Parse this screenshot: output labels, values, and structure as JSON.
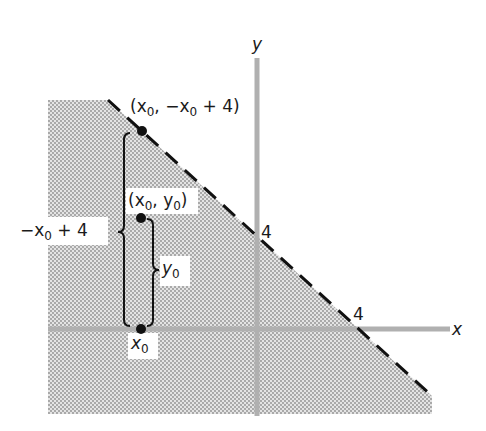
{
  "figure": {
    "axes": {
      "x_label": "x",
      "y_label": "y",
      "x_intercept_label": "4",
      "y_intercept_label": "4",
      "axis_color": "#b0b0b0"
    },
    "boundary_line": {
      "equation": "y = -x + 4",
      "style": "dashed",
      "color": "#111111"
    },
    "shaded_region": {
      "description": "y < -x + 4",
      "fill": "#d6d6d6",
      "dot_color": "#9a9a9a"
    },
    "points": [
      {
        "id": "on-line",
        "label_prefix": "(x",
        "label_sub": "0",
        "label_mid": ", −x",
        "label_sub2": "0",
        "label_suffix": " + 4)"
      },
      {
        "id": "inside",
        "label_prefix": "(x",
        "label_sub": "0",
        "label_mid": ", y",
        "label_sub2": "0",
        "label_suffix": ")"
      },
      {
        "id": "on-axis",
        "label_prefix": "x",
        "label_sub": "0"
      }
    ],
    "braces": [
      {
        "id": "tall",
        "label_prefix": "−x",
        "label_sub": "0",
        "label_suffix": " + 4"
      },
      {
        "id": "short",
        "label_prefix": "y",
        "label_sub": "0"
      }
    ]
  }
}
